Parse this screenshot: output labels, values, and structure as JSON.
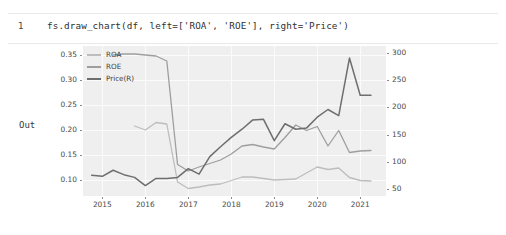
{
  "notebook": {
    "prompt_number": "1",
    "code": "fs.draw_chart(df, left=['ROA', 'ROE'], right='Price')",
    "out_label": "Out"
  },
  "chart_data": {
    "type": "line",
    "title": "",
    "xlabel": "",
    "ylabel_left": "",
    "ylabel_right": "",
    "grid": true,
    "legend_position": "upper-left",
    "background": "#efefef",
    "xlim": [
      2014.55,
      2021.6
    ],
    "xticks": [
      "2015",
      "2016",
      "2017",
      "2018",
      "2019",
      "2020",
      "2021"
    ],
    "xtick_values": [
      2015,
      2016,
      2017,
      2018,
      2019,
      2020,
      2021
    ],
    "ylim_left": [
      0.068,
      0.368
    ],
    "yticks_left": [
      "0.10",
      "0.15",
      "0.20",
      "0.25",
      "0.30",
      "0.35"
    ],
    "ytick_values_left": [
      0.1,
      0.15,
      0.2,
      0.25,
      0.3,
      0.35
    ],
    "ylim_right": [
      38,
      312
    ],
    "yticks_right": [
      "50",
      "100",
      "150",
      "200",
      "250",
      "300"
    ],
    "ytick_values_right": [
      50,
      100,
      150,
      200,
      250,
      300
    ],
    "colors": {
      "roa": "#bdbdbd",
      "roe": "#9e9e9e",
      "price": "#6e6e6e"
    },
    "series": [
      {
        "name": "ROA",
        "axis": "left",
        "color": "#bdbdbd",
        "x": [
          2015.75,
          2016.0,
          2016.25,
          2016.5,
          2016.75,
          2017.0,
          2017.25,
          2017.5,
          2017.75,
          2018.0,
          2018.25,
          2018.5,
          2018.75,
          2019.0,
          2019.25,
          2019.5,
          2019.75,
          2020.0,
          2020.25,
          2020.5,
          2020.75,
          2021.0,
          2021.25
        ],
        "values": [
          0.208,
          0.2,
          0.215,
          0.212,
          0.096,
          0.083,
          0.086,
          0.09,
          0.092,
          0.099,
          0.106,
          0.106,
          0.103,
          0.1,
          0.101,
          0.102,
          0.114,
          0.126,
          0.121,
          0.124,
          0.105,
          0.099,
          0.098
        ]
      },
      {
        "name": "ROE",
        "axis": "left",
        "color": "#9e9e9e",
        "x": [
          2015.25,
          2015.5,
          2015.75,
          2016.0,
          2016.25,
          2016.5,
          2016.75,
          2017.0,
          2017.25,
          2017.5,
          2017.75,
          2018.0,
          2018.25,
          2018.5,
          2018.75,
          2019.0,
          2019.25,
          2019.5,
          2019.75,
          2020.0,
          2020.25,
          2020.5,
          2020.75,
          2021.0,
          2021.25
        ],
        "values": [
          0.35,
          0.352,
          0.352,
          0.35,
          0.348,
          0.338,
          0.131,
          0.118,
          0.126,
          0.133,
          0.14,
          0.152,
          0.168,
          0.171,
          0.166,
          0.162,
          0.185,
          0.21,
          0.199,
          0.207,
          0.168,
          0.199,
          0.155,
          0.158,
          0.159
        ]
      },
      {
        "name": "Price(R)",
        "axis": "right",
        "color": "#6e6e6e",
        "x": [
          2014.75,
          2015.0,
          2015.25,
          2015.5,
          2015.75,
          2016.0,
          2016.25,
          2016.5,
          2016.75,
          2017.0,
          2017.25,
          2017.5,
          2017.75,
          2018.0,
          2018.25,
          2018.5,
          2018.75,
          2019.0,
          2019.25,
          2019.5,
          2019.75,
          2020.0,
          2020.25,
          2020.5,
          2020.75,
          2021.0,
          2021.25
        ],
        "values": [
          76,
          74,
          85,
          77,
          72,
          57,
          70,
          70,
          72,
          88,
          78,
          110,
          128,
          145,
          160,
          177,
          178,
          139,
          170,
          160,
          162,
          182,
          196,
          185,
          290,
          222,
          222
        ]
      }
    ],
    "legend": [
      {
        "label": "ROA",
        "color": "#bdbdbd"
      },
      {
        "label": "ROE",
        "color": "#9e9e9e"
      },
      {
        "label": "Price(R)",
        "color": "#6e6e6e"
      }
    ]
  }
}
